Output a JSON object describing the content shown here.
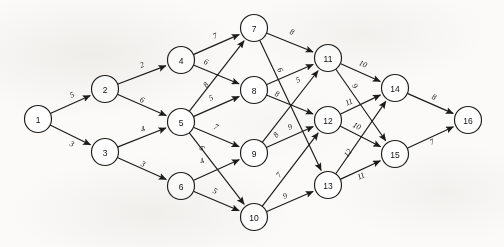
{
  "diagram": {
    "type": "directed-acyclic-network",
    "node_count": 16,
    "edge_count": 30,
    "colors": {
      "background": "#fbfaf8",
      "stroke": "#1b1b1b",
      "node_fill": "#ffffff",
      "label": "#111111"
    },
    "nodes": [
      {
        "id": "1",
        "label": "1",
        "x": 38,
        "y": 119,
        "r": 13.5
      },
      {
        "id": "2",
        "label": "2",
        "x": 105,
        "y": 89,
        "r": 13.5
      },
      {
        "id": "3",
        "label": "3",
        "x": 105,
        "y": 152,
        "r": 13.5
      },
      {
        "id": "4",
        "label": "4",
        "x": 181,
        "y": 60,
        "r": 13.5
      },
      {
        "id": "5",
        "label": "5",
        "x": 181,
        "y": 122,
        "r": 13.5
      },
      {
        "id": "6",
        "label": "6",
        "x": 181,
        "y": 186,
        "r": 13.5
      },
      {
        "id": "7",
        "label": "7",
        "x": 254,
        "y": 28,
        "r": 13.5
      },
      {
        "id": "8",
        "label": "8",
        "x": 254,
        "y": 90,
        "r": 13.5
      },
      {
        "id": "9",
        "label": "9",
        "x": 254,
        "y": 153,
        "r": 13.5
      },
      {
        "id": "10",
        "label": "10",
        "x": 254,
        "y": 217,
        "r": 13.5
      },
      {
        "id": "11",
        "label": "11",
        "x": 328,
        "y": 58,
        "r": 13.5
      },
      {
        "id": "12",
        "label": "12",
        "x": 328,
        "y": 120,
        "r": 13.5
      },
      {
        "id": "13",
        "label": "13",
        "x": 328,
        "y": 185,
        "r": 13.5
      },
      {
        "id": "14",
        "label": "14",
        "x": 395,
        "y": 88,
        "r": 13.5
      },
      {
        "id": "15",
        "label": "15",
        "x": 395,
        "y": 154,
        "r": 13.5
      },
      {
        "id": "16",
        "label": "16",
        "x": 468,
        "y": 120,
        "r": 13.5
      }
    ],
    "edges": [
      {
        "from": "1",
        "to": "2",
        "weight": "5",
        "lx": 72,
        "ly": 95
      },
      {
        "from": "1",
        "to": "3",
        "weight": "3",
        "lx": 72,
        "ly": 144
      },
      {
        "from": "2",
        "to": "4",
        "weight": "2",
        "lx": 142,
        "ly": 65
      },
      {
        "from": "2",
        "to": "5",
        "weight": "6",
        "lx": 142,
        "ly": 100
      },
      {
        "from": "3",
        "to": "5",
        "weight": "4",
        "lx": 143,
        "ly": 129
      },
      {
        "from": "3",
        "to": "6",
        "weight": "3",
        "lx": 143,
        "ly": 164
      },
      {
        "from": "4",
        "to": "7",
        "weight": "7",
        "lx": 215,
        "ly": 36
      },
      {
        "from": "4",
        "to": "8",
        "weight": "6",
        "lx": 206,
        "ly": 62
      },
      {
        "from": "5",
        "to": "7",
        "weight": "8",
        "lx": 206,
        "ly": 85
      },
      {
        "from": "5",
        "to": "8",
        "weight": "5",
        "lx": 211,
        "ly": 98
      },
      {
        "from": "5",
        "to": "9",
        "weight": "7",
        "lx": 216,
        "ly": 127
      },
      {
        "from": "5",
        "to": "10",
        "weight": "6",
        "lx": 202,
        "ly": 148
      },
      {
        "from": "6",
        "to": "9",
        "weight": "4",
        "lx": 202,
        "ly": 161
      },
      {
        "from": "6",
        "to": "10",
        "weight": "5",
        "lx": 215,
        "ly": 191
      },
      {
        "from": "7",
        "to": "11",
        "weight": "8",
        "lx": 292,
        "ly": 32
      },
      {
        "from": "7",
        "to": "13",
        "weight": "6",
        "lx": 280,
        "ly": 70
      },
      {
        "from": "8",
        "to": "11",
        "weight": "5",
        "lx": 298,
        "ly": 80
      },
      {
        "from": "8",
        "to": "12",
        "weight": "8",
        "lx": 277,
        "ly": 94
      },
      {
        "from": "9",
        "to": "11",
        "weight": "8",
        "lx": 276,
        "ly": 135
      },
      {
        "from": "9",
        "to": "12",
        "weight": "9",
        "lx": 290,
        "ly": 127
      },
      {
        "from": "10",
        "to": "12",
        "weight": "7",
        "lx": 279,
        "ly": 175
      },
      {
        "from": "10",
        "to": "13",
        "weight": "9",
        "lx": 285,
        "ly": 196
      },
      {
        "from": "11",
        "to": "14",
        "weight": "10",
        "lx": 363,
        "ly": 64
      },
      {
        "from": "11",
        "to": "15",
        "weight": "9",
        "lx": 355,
        "ly": 86
      },
      {
        "from": "12",
        "to": "14",
        "weight": "11",
        "lx": 349,
        "ly": 102
      },
      {
        "from": "12",
        "to": "15",
        "weight": "10",
        "lx": 357,
        "ly": 126
      },
      {
        "from": "13",
        "to": "14",
        "weight": "12",
        "lx": 348,
        "ly": 153
      },
      {
        "from": "13",
        "to": "15",
        "weight": "11",
        "lx": 361,
        "ly": 176
      },
      {
        "from": "14",
        "to": "16",
        "weight": "8",
        "lx": 434,
        "ly": 97
      },
      {
        "from": "15",
        "to": "16",
        "weight": "7",
        "lx": 432,
        "ly": 142
      }
    ]
  }
}
